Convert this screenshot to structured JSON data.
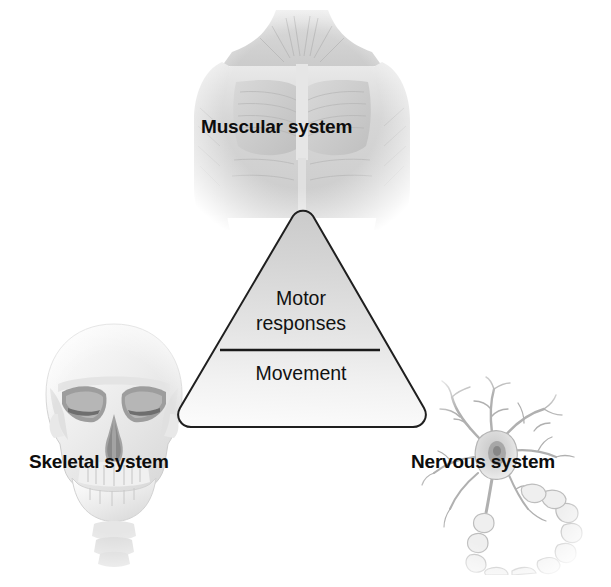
{
  "figure": {
    "background_color": "#ffffff",
    "text_color": "#111111"
  },
  "center_shape": {
    "type": "rounded-triangle",
    "name": "motor-triangle",
    "outline_color": "#1a1a1a",
    "fill_top_color": "#cfcfcf",
    "fill_bottom_color": "#f7f7f7",
    "lines": {
      "upper": "Motor\nresponses",
      "upper_line_1": "Motor",
      "upper_line_2": "responses",
      "lower": "Movement"
    }
  },
  "systems": [
    {
      "id": "muscular",
      "label": "Muscular system",
      "icon": "muscular-torso-illustration",
      "position": "top"
    },
    {
      "id": "skeletal",
      "label": "Skeletal system",
      "icon": "skull-illustration",
      "position": "bottom-left"
    },
    {
      "id": "nervous",
      "label": "Nervous system",
      "icon": "neuron-illustration",
      "position": "bottom-right"
    }
  ]
}
